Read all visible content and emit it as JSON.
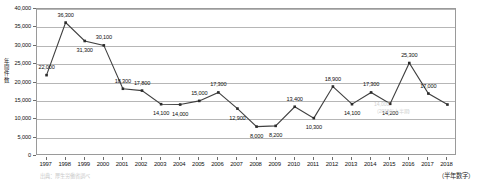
{
  "chart_data": {
    "type": "line",
    "title": "",
    "xlabel": "",
    "ylabel": "年間件数",
    "ylim": [
      0,
      40000
    ],
    "grid": true,
    "legend_position": "none",
    "categories": [
      "1997",
      "1998",
      "1999",
      "2000",
      "2001",
      "2002",
      "2003",
      "2004",
      "2005",
      "2006",
      "2007",
      "2008",
      "2009",
      "2010",
      "2011",
      "2012",
      "2013",
      "2014",
      "2015",
      "2016",
      "2017",
      "2018"
    ],
    "values": [
      22000,
      36300,
      31300,
      30100,
      18300,
      17800,
      14100,
      14000,
      15000,
      17300,
      12900,
      8000,
      8200,
      13400,
      10300,
      18900,
      14100,
      17300,
      14200,
      25300,
      17000,
      14000
    ],
    "point_labels": [
      "22,000",
      "36,300",
      "31,300",
      "30,100",
      "18,300",
      "17,800",
      "14,100",
      "14,000",
      "15,000",
      "17,300",
      "12,900",
      "8,000",
      "8,200",
      "13,400",
      "10,300",
      "18,900",
      "14,100",
      "17,300",
      "14,200",
      "25,300",
      "17,000",
      ""
    ],
    "y_ticks": [
      0,
      5000,
      10000,
      15000,
      20000,
      25000,
      30000,
      35000,
      40000
    ],
    "y_tick_labels": [
      "0",
      "5,000",
      "10,000",
      "15,000",
      "20,000",
      "25,000",
      "30,000",
      "35,000",
      "40,000"
    ],
    "series_color": "#404040",
    "marker_color": "#2b2b2b",
    "gridline_color": "#b6b6b6"
  },
  "axis": {
    "y_title": "年間件数",
    "y_title_chars": [
      "年",
      "間",
      "件",
      "数"
    ]
  },
  "notes": {
    "footnote": "（半年数字）",
    "source": "出典：厚生労働省調べ"
  },
  "annotation": {
    "line1": "14,000",
    "line2": "（2018年上半期）"
  }
}
